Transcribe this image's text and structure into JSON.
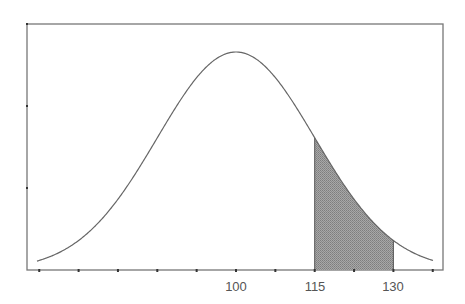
{
  "chart_data": {
    "type": "area",
    "title": "",
    "xlabel": "",
    "ylabel": "",
    "distribution": "normal",
    "mean": 100,
    "sd": 15,
    "xlim": [
      58,
      140
    ],
    "x_tick_step": 7.5,
    "x_ticks": [
      62.5,
      70,
      77.5,
      85,
      92.5,
      100,
      107.5,
      115,
      122.5,
      130,
      137.5
    ],
    "x_tick_labels": [
      {
        "value": 100,
        "label": "100"
      },
      {
        "value": 115,
        "label": "115"
      },
      {
        "value": 130,
        "label": "130"
      }
    ],
    "y_ticks_count": 3,
    "shaded_region": {
      "from": 115,
      "to": 130
    },
    "grid": false,
    "legend": null
  },
  "colors": {
    "axis": "#777777",
    "curve": "#666666",
    "shade": "#9a9a9a",
    "shade_stroke": "#555555",
    "text": "#555555"
  },
  "labels": {
    "x100": "100",
    "x115": "115",
    "x130": "130"
  }
}
